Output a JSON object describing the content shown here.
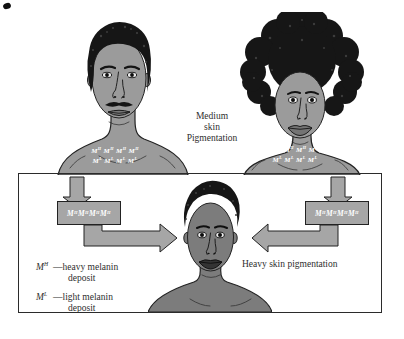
{
  "colors": {
    "background": "#ffffff",
    "parent_skin": "#9b9b9b",
    "child_skin": "#7c7c7c",
    "hair": "#161616",
    "outline": "#222222",
    "arrow_box_fill": "#a6a6a6",
    "genotype_text": "#ffffff",
    "caption_text": "#2e2e2e"
  },
  "parents": {
    "caption": "Medium\nskin\nPigmentation",
    "father": {
      "genotype_row1": "M^H M^H M^H M^H",
      "genotype_row2": "M^L M^L M^L M^L"
    },
    "mother": {
      "genotype_row1": "M^H M^H M^H M^H",
      "genotype_row2": "M^L M^L M^L M^L"
    }
  },
  "panel": {
    "left_gamete_box_label": "M^H M^H M^H M^H",
    "right_gamete_box_label": "M^H M^H M^H M^H",
    "child_caption": "Heavy skin pigmentation",
    "legend": [
      {
        "symbol": "M^H",
        "description": "—heavy melanin\ndeposit"
      },
      {
        "symbol": "M^L",
        "description": "—light melanin\ndeposit"
      }
    ]
  }
}
